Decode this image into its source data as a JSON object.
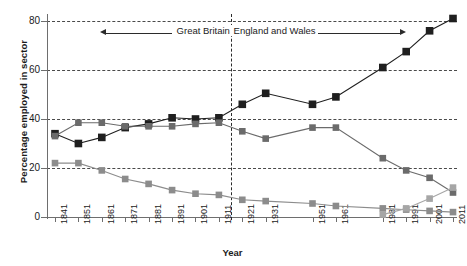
{
  "chart_data": {
    "type": "line",
    "title": "",
    "xlabel": "Year",
    "ylabel": "Percentage employed in sector",
    "ylim": [
      0,
      85
    ],
    "y_ticks": [
      0,
      20,
      40,
      60,
      80
    ],
    "grid": "horizontal-dashed",
    "legend": "none",
    "categories": [
      "1841",
      "1851",
      "1861",
      "1871",
      "1881",
      "1891",
      "1901",
      "1911",
      "1921",
      "1931",
      "1951",
      "1961",
      "1981",
      "1991",
      "2001",
      "2011"
    ],
    "series": [
      {
        "name": "services",
        "color": "#1f1f1f",
        "marker": "square",
        "values": [
          34,
          30,
          32.5,
          36.5,
          38,
          40.5,
          40,
          40.5,
          46,
          50.5,
          46,
          49,
          61,
          67.5,
          76,
          81
        ]
      },
      {
        "name": "manufacturing",
        "color": "#6b6b6b",
        "marker": "square",
        "values": [
          33,
          38.5,
          38.5,
          37,
          37,
          37,
          38,
          38.5,
          35,
          32,
          36.5,
          36.5,
          24,
          19,
          16,
          10
        ]
      },
      {
        "name": "agriculture",
        "color": "#8c8c8c",
        "marker": "square",
        "values": [
          22,
          22,
          19,
          15.5,
          13.5,
          11,
          9.5,
          9,
          7,
          6.5,
          5.5,
          4.5,
          3.5,
          3,
          2.5,
          2
        ]
      },
      {
        "name": "other",
        "color": "#a6a6a6",
        "marker": "square",
        "values": [
          null,
          null,
          null,
          null,
          null,
          null,
          null,
          null,
          null,
          null,
          null,
          null,
          1,
          3.5,
          7.5,
          12
        ]
      }
    ],
    "annotations": [
      {
        "name": "region-annotation",
        "left_label": "Great Britain",
        "right_label": "England and Wales",
        "divider_after_category": "1911",
        "y_value": 74
      }
    ]
  },
  "axis": {
    "y_tick_labels": [
      "80",
      "60",
      "40",
      "20",
      "0"
    ],
    "x_tick_labels": [
      "1841",
      "1851",
      "1861",
      "1871",
      "1881",
      "1891",
      "1901",
      "1911",
      "1921",
      "1931",
      "1951",
      "1961",
      "1981",
      "1991",
      "2001",
      "2011"
    ]
  },
  "colors": {
    "services": "#1f1f1f",
    "manufacturing": "#6b6b6b",
    "agriculture": "#8c8c8c",
    "other": "#a6a6a6",
    "grid": "#2b2b2b",
    "axis": "#6e6e6e",
    "background": "#ffffff"
  }
}
